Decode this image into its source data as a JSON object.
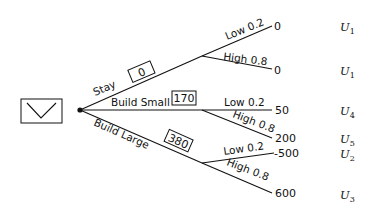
{
  "diagram": {
    "type": "decision-tree",
    "decision_node": {
      "icon": "decision-box-icon"
    },
    "branches": [
      {
        "label": "Stay",
        "expected_value": "0",
        "outcomes": [
          {
            "label": "Low 0.2",
            "payoff": "0",
            "utility": "U",
            "utility_sub": "1"
          },
          {
            "label": "High 0.8",
            "payoff": "0",
            "utility": "U",
            "utility_sub": "1"
          }
        ]
      },
      {
        "label": "Build Small",
        "expected_value": "170",
        "outcomes": [
          {
            "label": "Low 0.2",
            "payoff": "50",
            "utility": "U",
            "utility_sub": "4"
          },
          {
            "label": "High 0.8",
            "payoff": "200",
            "utility": "U",
            "utility_sub": "5"
          }
        ]
      },
      {
        "label": "Build Large",
        "expected_value": "380",
        "outcomes": [
          {
            "label": "Low 0.2",
            "payoff": "-500",
            "utility": "U",
            "utility_sub": "2"
          },
          {
            "label": "High 0.8",
            "payoff": "600",
            "utility": "U",
            "utility_sub": "3"
          }
        ]
      }
    ]
  }
}
